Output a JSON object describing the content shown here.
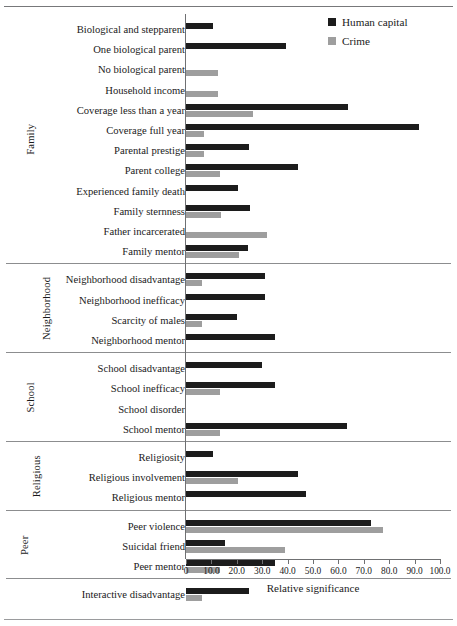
{
  "chart_data": {
    "type": "bar",
    "orientation": "horizontal",
    "title": "",
    "xlabel": "Relative significance",
    "ylabel": "",
    "xlim": [
      0,
      100
    ],
    "xticks": [
      0,
      10,
      20,
      30,
      40,
      50,
      60,
      70,
      80,
      90,
      100
    ],
    "xtick_labels": [
      "0",
      "10.0",
      "20.0",
      "30.0",
      "40.0",
      "50.0",
      "60.0",
      "70.0",
      "80.0",
      "90.0",
      "100.0"
    ],
    "grid": false,
    "legend_position": "top-right",
    "series": [
      {
        "name": "Human capital",
        "color": "#1c1c1c"
      },
      {
        "name": "Crime",
        "color": "#9e9e9e"
      }
    ],
    "groups": [
      {
        "label": "Family",
        "categories": [
          {
            "label": "Biological and stepparent",
            "human_capital": 10.6,
            "crime": 0
          },
          {
            "label": "One biological parent",
            "human_capital": 39.4,
            "crime": 0
          },
          {
            "label": "No biological parent",
            "human_capital": 0,
            "crime": 12.6
          },
          {
            "label": "Household income",
            "human_capital": 0,
            "crime": 12.6
          },
          {
            "label": "Coverage less than a year",
            "human_capital": 63.8,
            "crime": 26.4
          },
          {
            "label": "Coverage full year",
            "human_capital": 91.7,
            "crime": 7.1
          },
          {
            "label": "Parental prestige",
            "human_capital": 24.8,
            "crime": 7.1
          },
          {
            "label": "Parent college",
            "human_capital": 44.1,
            "crime": 13.4
          },
          {
            "label": "Experienced family death",
            "human_capital": 20.5,
            "crime": 0
          },
          {
            "label": "Family sternness",
            "human_capital": 25.2,
            "crime": 13.8
          },
          {
            "label": "Father incarcerated",
            "human_capital": 0,
            "crime": 31.9
          },
          {
            "label": "Family mentor",
            "human_capital": 24.4,
            "crime": 20.9
          }
        ]
      },
      {
        "label": "Neighborhood",
        "categories": [
          {
            "label": "Neighborhood disadvantage",
            "human_capital": 31.1,
            "crime": 6.4
          },
          {
            "label": "Neighborhood inefficacy",
            "human_capital": 31.1,
            "crime": 0
          },
          {
            "label": "Scarcity of males",
            "human_capital": 20.1,
            "crime": 6.4
          },
          {
            "label": "Neighborhood mentor",
            "human_capital": 35.0,
            "crime": 0
          }
        ]
      },
      {
        "label": "School",
        "categories": [
          {
            "label": "School disadvantage",
            "human_capital": 30.0,
            "crime": 0
          },
          {
            "label": "School inefficacy",
            "human_capital": 35.0,
            "crime": 13.4
          },
          {
            "label": "School disorder",
            "human_capital": 0,
            "crime": 0
          },
          {
            "label": "School mentor",
            "human_capital": 63.4,
            "crime": 13.4
          }
        ]
      },
      {
        "label": "Religious",
        "categories": [
          {
            "label": "Religiosity",
            "human_capital": 10.6,
            "crime": 0
          },
          {
            "label": "Religious involvement",
            "human_capital": 44.1,
            "crime": 20.5
          },
          {
            "label": "Religious mentor",
            "human_capital": 47.2,
            "crime": 0
          }
        ]
      },
      {
        "label": "Peer",
        "categories": [
          {
            "label": "Peer violence",
            "human_capital": 72.8,
            "crime": 77.6
          },
          {
            "label": "Suicidal friend",
            "human_capital": 15.4,
            "crime": 39.0
          },
          {
            "label": "Peer mentor",
            "human_capital": 35.0,
            "crime": 13.4
          }
        ]
      },
      {
        "label": "",
        "categories": [
          {
            "label": "Interactive disadvantage",
            "human_capital": 24.8,
            "crime": 6.4
          }
        ]
      }
    ]
  },
  "legend": {
    "items": [
      {
        "label": "Human capital",
        "swatch": "legend-swatch-black"
      },
      {
        "label": "Crime",
        "swatch": "legend-swatch-gray"
      }
    ]
  },
  "axis": {
    "title": "Relative significance"
  }
}
